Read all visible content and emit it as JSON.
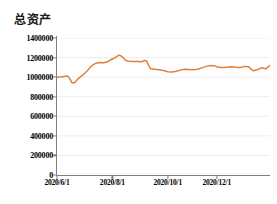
{
  "chart_data": {
    "type": "line",
    "title": "总资产",
    "xlabel": "",
    "ylabel": "",
    "ylim": [
      0,
      1400000
    ],
    "yticks": [
      0,
      200000,
      400000,
      600000,
      800000,
      1000000,
      1200000,
      1400000
    ],
    "ytick_labels": [
      "0",
      "200000",
      "400000",
      "600000",
      "800000",
      "1000000",
      "1200000",
      "1400000"
    ],
    "xtick_labels": [
      "2020/6/1",
      "2020/8/1",
      "2020/10/1",
      "2020/12/1"
    ],
    "xtick_positions": [
      0,
      26,
      52,
      75
    ],
    "xlim": [
      0,
      100
    ],
    "grid": true,
    "legend": false,
    "series": [
      {
        "name": "总资产",
        "color": "#E0803C",
        "x": [
          0,
          2,
          4,
          5,
          6,
          7,
          8,
          9,
          10,
          12,
          14,
          16,
          18,
          20,
          22,
          24,
          25,
          26,
          27,
          28,
          29,
          30,
          31,
          32,
          33,
          34,
          36,
          38,
          40,
          41,
          42,
          43,
          44,
          46,
          48,
          50,
          52,
          54,
          56,
          58,
          60,
          62,
          64,
          66,
          68,
          70,
          72,
          74,
          76,
          78,
          80,
          82,
          84,
          86,
          88,
          90,
          92,
          94,
          96,
          98,
          100
        ],
        "values": [
          1000000,
          1003000,
          1010000,
          1012000,
          985000,
          945000,
          940000,
          960000,
          985000,
          1020000,
          1060000,
          1110000,
          1140000,
          1150000,
          1148000,
          1160000,
          1175000,
          1185000,
          1195000,
          1210000,
          1225000,
          1218000,
          1200000,
          1175000,
          1165000,
          1162000,
          1160000,
          1160000,
          1158000,
          1170000,
          1168000,
          1120000,
          1085000,
          1080000,
          1075000,
          1068000,
          1055000,
          1052000,
          1060000,
          1072000,
          1080000,
          1078000,
          1076000,
          1080000,
          1095000,
          1110000,
          1118000,
          1115000,
          1100000,
          1098000,
          1102000,
          1105000,
          1100000,
          1098000,
          1110000,
          1105000,
          1065000,
          1075000,
          1095000,
          1085000,
          1120000
        ]
      }
    ]
  },
  "axis": {
    "axis_color": "#808080",
    "grid_color": "#EDEDED"
  }
}
